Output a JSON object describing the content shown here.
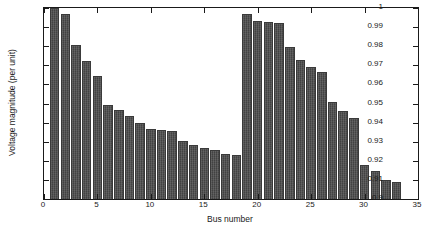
{
  "chart_data": {
    "type": "bar",
    "title": "",
    "subtitle": "",
    "xlabel": "Bus number",
    "ylabel": "Voltage magnitude (per unit)",
    "xlim": [
      0,
      35
    ],
    "ylim": [
      0.9,
      1.0
    ],
    "xticks": [
      0,
      5,
      10,
      15,
      20,
      25,
      30,
      35
    ],
    "xtick_labels": [
      "0",
      "5",
      "10",
      "15",
      "20",
      "25",
      "30",
      "35"
    ],
    "yticks": [
      0.9,
      0.91,
      0.92,
      0.93,
      0.94,
      0.95,
      0.96,
      0.97,
      0.98,
      0.99,
      1.0
    ],
    "ytick_labels": [
      "0.9",
      "0.91",
      "0.92",
      "0.93",
      "0.94",
      "0.95",
      "0.96",
      "0.97",
      "0.98",
      "0.99",
      "1"
    ],
    "grid": false,
    "legend": null,
    "bar_color": "#4d4d4d",
    "bar_edge_color": "#3a3a3a",
    "axes_color": "#1a1a1a",
    "background_color": "#ffffff",
    "categories": [
      1,
      2,
      3,
      4,
      5,
      6,
      7,
      8,
      9,
      10,
      11,
      12,
      13,
      14,
      15,
      16,
      17,
      18,
      19,
      20,
      21,
      22,
      23,
      24,
      25,
      26,
      27,
      28,
      29,
      30,
      31,
      32,
      33
    ],
    "values": [
      1.0,
      0.9968,
      0.9805,
      0.9724,
      0.9643,
      0.9493,
      0.9465,
      0.9436,
      0.94,
      0.9368,
      0.9363,
      0.9355,
      0.9304,
      0.9285,
      0.9267,
      0.9255,
      0.9234,
      0.9228,
      0.9967,
      0.9931,
      0.9927,
      0.9923,
      0.9795,
      0.9726,
      0.9692,
      0.9665,
      0.9506,
      0.946,
      0.9426,
      0.918,
      0.9147,
      0.91,
      0.909
    ]
  }
}
